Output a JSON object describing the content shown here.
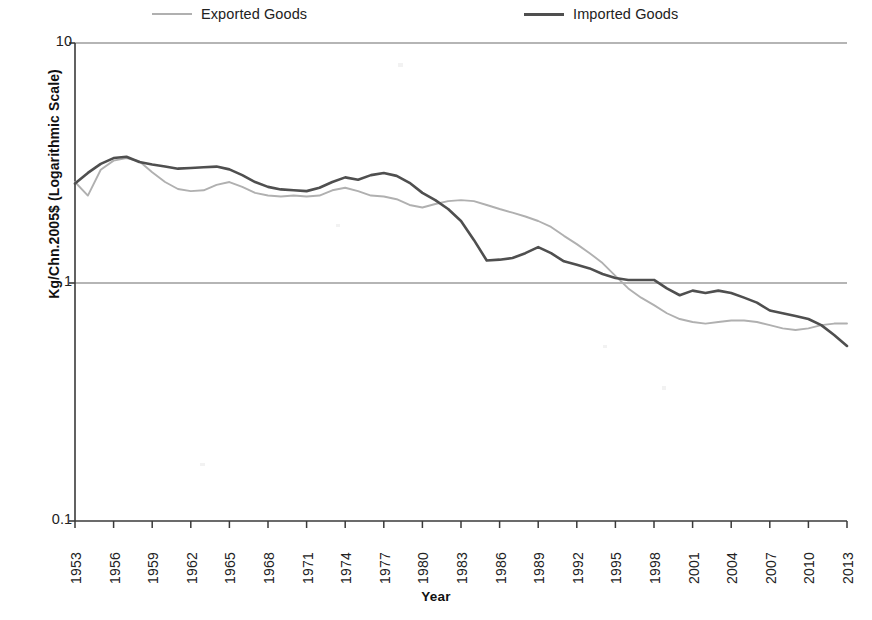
{
  "legend": {
    "position": "top",
    "items": [
      {
        "label": "Exported Goods",
        "color": "#b0b0b0",
        "key": "exported"
      },
      {
        "label": "Imported Goods",
        "color": "#4f4f4f",
        "key": "imported"
      }
    ]
  },
  "axes": {
    "ylabel": "Kg/Chn.2005$ (Logarithmic Scale)",
    "xlabel": "Year",
    "yticks": [
      "10",
      "1",
      "0.1"
    ],
    "xticks": [
      "1953",
      "1956",
      "1959",
      "1962",
      "1965",
      "1968",
      "1971",
      "1974",
      "1977",
      "1980",
      "1983",
      "1986",
      "1989",
      "1992",
      "1995",
      "1998",
      "2001",
      "2004",
      "2007",
      "2010",
      "2013"
    ]
  },
  "chart_data": {
    "type": "line",
    "title": "",
    "xlabel": "Year",
    "ylabel": "Kg/Chn.2005$ (Logarithmic Scale)",
    "yscale": "log",
    "ylim": [
      0.1,
      10
    ],
    "xlim": [
      1953,
      2013
    ],
    "grid": false,
    "legend_position": "top",
    "x": [
      1953,
      1954,
      1955,
      1956,
      1957,
      1958,
      1959,
      1960,
      1961,
      1962,
      1963,
      1964,
      1965,
      1966,
      1967,
      1968,
      1969,
      1970,
      1971,
      1972,
      1973,
      1974,
      1975,
      1976,
      1977,
      1978,
      1979,
      1980,
      1981,
      1982,
      1983,
      1984,
      1985,
      1986,
      1987,
      1988,
      1989,
      1990,
      1991,
      1992,
      1993,
      1994,
      1995,
      1996,
      1997,
      1998,
      1999,
      2000,
      2001,
      2002,
      2003,
      2004,
      2005,
      2006,
      2007,
      2008,
      2009,
      2010,
      2011,
      2012,
      2013
    ],
    "series": [
      {
        "name": "Exported Goods",
        "color": "#b0b0b0",
        "values": [
          2.62,
          2.3,
          2.95,
          3.22,
          3.3,
          3.2,
          2.88,
          2.62,
          2.45,
          2.4,
          2.42,
          2.55,
          2.62,
          2.5,
          2.36,
          2.3,
          2.28,
          2.3,
          2.28,
          2.3,
          2.42,
          2.48,
          2.4,
          2.3,
          2.28,
          2.22,
          2.1,
          2.05,
          2.12,
          2.18,
          2.2,
          2.18,
          2.1,
          2.02,
          1.95,
          1.88,
          1.8,
          1.7,
          1.56,
          1.44,
          1.32,
          1.2,
          1.06,
          0.94,
          0.86,
          0.8,
          0.74,
          0.7,
          0.68,
          0.67,
          0.68,
          0.69,
          0.69,
          0.68,
          0.66,
          0.64,
          0.63,
          0.64,
          0.66,
          0.67,
          0.67
        ]
      },
      {
        "name": "Imported Goods",
        "color": "#4f4f4f",
        "values": [
          2.58,
          2.86,
          3.12,
          3.3,
          3.34,
          3.18,
          3.1,
          3.04,
          2.98,
          3.0,
          3.02,
          3.04,
          2.96,
          2.8,
          2.62,
          2.5,
          2.44,
          2.42,
          2.4,
          2.48,
          2.62,
          2.74,
          2.68,
          2.8,
          2.86,
          2.78,
          2.6,
          2.36,
          2.2,
          2.02,
          1.8,
          1.5,
          1.23,
          1.24,
          1.26,
          1.32,
          1.4,
          1.32,
          1.22,
          1.18,
          1.14,
          1.08,
          1.04,
          1.02,
          1.02,
          1.02,
          0.94,
          0.88,
          0.92,
          0.9,
          0.92,
          0.9,
          0.86,
          0.82,
          0.76,
          0.74,
          0.72,
          0.7,
          0.66,
          0.6,
          0.54
        ]
      }
    ]
  }
}
